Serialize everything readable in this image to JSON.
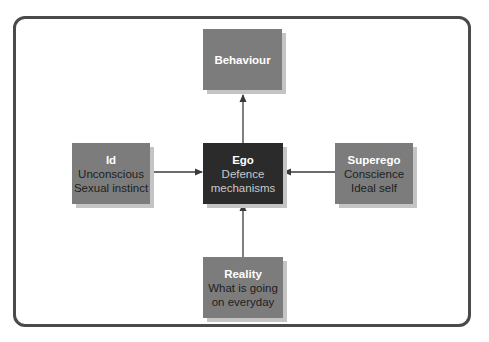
{
  "diagram": {
    "nodes": {
      "behaviour": {
        "title": "Behaviour",
        "lines": []
      },
      "ego": {
        "title": "Ego",
        "lines": [
          "Defence",
          "mechanisms"
        ]
      },
      "id": {
        "title": "Id",
        "lines": [
          "Unconscious",
          "Sexual instinct"
        ]
      },
      "superego": {
        "title": "Superego",
        "lines": [
          "Conscience",
          "Ideal self"
        ]
      },
      "reality": {
        "title": "Reality",
        "lines": [
          "What is going",
          "on everyday"
        ]
      }
    },
    "edges": [
      {
        "from": "ego",
        "to": "behaviour"
      },
      {
        "from": "id",
        "to": "ego"
      },
      {
        "from": "superego",
        "to": "ego"
      },
      {
        "from": "reality",
        "to": "ego"
      }
    ],
    "colors": {
      "node_fill": "#7c7c7c",
      "center_fill": "#2b2b2b",
      "shadow": "#c4c4c4",
      "arrow": "#3a3a3a",
      "frame": "#4a4a4a"
    }
  }
}
